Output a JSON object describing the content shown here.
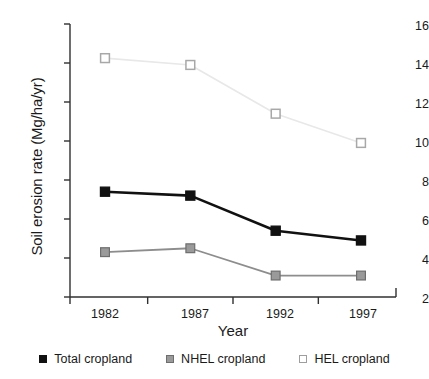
{
  "chart_data": {
    "type": "line",
    "title": "",
    "xlabel": "Year",
    "ylabel": "Soil erosion rate (Mg/ha/yr)",
    "categories": [
      "1982",
      "1987",
      "1992",
      "1997"
    ],
    "x": [
      1982,
      1987,
      1992,
      1997
    ],
    "ylim": [
      2,
      16
    ],
    "yticks": [
      2,
      4,
      6,
      8,
      10,
      12,
      14,
      16
    ],
    "ytick_labels": [
      "2",
      "4",
      "6",
      "8",
      "10",
      "12",
      "14",
      "16"
    ],
    "grid": false,
    "legend_position": "bottom",
    "series": [
      {
        "name": "Total cropland",
        "values": [
          7.4,
          7.2,
          5.4,
          4.9
        ],
        "color": "#111111",
        "marker": "filled-square",
        "marker_fill": "#111111",
        "marker_edge": "#111111"
      },
      {
        "name": "NHEL cropland",
        "values": [
          4.3,
          4.5,
          3.1,
          3.1
        ],
        "color": "#8d8d8d",
        "marker": "filled-square",
        "marker_fill": "#9a9a9a",
        "marker_edge": "#6e6e6e"
      },
      {
        "name": "HEL cropland",
        "values": [
          14.25,
          13.9,
          11.4,
          9.9
        ],
        "color": "#e8e8e8",
        "marker": "open-square",
        "marker_fill": "#ffffff",
        "marker_edge": "#a8a8a8"
      }
    ]
  },
  "axis": {
    "ylabel_text": "Soil erosion rate (Mg/ha/yr)",
    "xlabel_text": "Year"
  },
  "legend": {
    "items": [
      {
        "label": "Total cropland"
      },
      {
        "label": "NHEL cropland"
      },
      {
        "label": "HEL cropland"
      }
    ]
  }
}
